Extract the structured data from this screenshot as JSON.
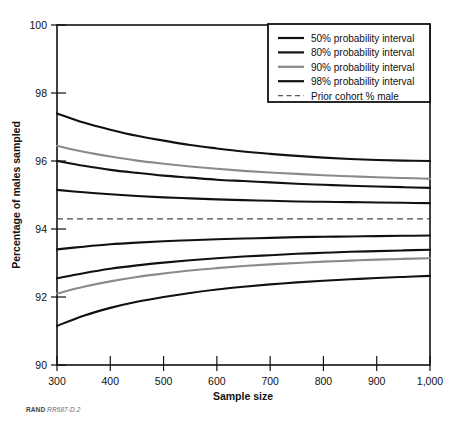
{
  "figure": {
    "source_note_prefix": "RAND",
    "source_note_id": "RR687-D.2"
  },
  "chart_data": {
    "type": "line",
    "title": "",
    "xlabel": "Sample size",
    "ylabel": "Percentage of males sampled",
    "xlim": [
      300,
      1000
    ],
    "ylim": [
      90,
      100
    ],
    "xticks": [
      300,
      400,
      500,
      600,
      700,
      800,
      900,
      1000
    ],
    "xtick_labels": [
      "300",
      "400",
      "500",
      "600",
      "700",
      "800",
      "900",
      "1,000"
    ],
    "yticks": [
      90,
      92,
      94,
      96,
      98,
      100
    ],
    "ytick_labels": [
      "90",
      "92",
      "94",
      "96",
      "98",
      "100"
    ],
    "grid": false,
    "legend_position": "top-right",
    "legend": [
      {
        "label": "50% probability interval",
        "color": "#111111",
        "style": "solid",
        "width": 2.2
      },
      {
        "label": "80% probability interval",
        "color": "#111111",
        "style": "solid",
        "width": 2.2
      },
      {
        "label": "90% probability interval",
        "color": "#8a8a8a",
        "style": "solid",
        "width": 2.2
      },
      {
        "label": "98% probability interval",
        "color": "#111111",
        "style": "solid",
        "width": 2.2
      },
      {
        "label": "Prior cohort % male",
        "color": "#555555",
        "style": "dashed",
        "width": 1.2
      }
    ],
    "prior_cohort_percent_male": 94.3,
    "x": [
      300,
      350,
      400,
      450,
      500,
      550,
      600,
      650,
      700,
      750,
      800,
      850,
      900,
      950,
      1000
    ],
    "series": [
      {
        "name": "98% probability interval upper",
        "interval": 98,
        "bound": "upper",
        "color": "#111111",
        "values": [
          97.4,
          97.13,
          96.92,
          96.74,
          96.6,
          96.47,
          96.37,
          96.28,
          96.21,
          96.15,
          96.1,
          96.06,
          96.03,
          96.01,
          96.0
        ]
      },
      {
        "name": "90% probability interval upper",
        "interval": 90,
        "bound": "upper",
        "color": "#8a8a8a",
        "values": [
          96.45,
          96.27,
          96.13,
          96.01,
          95.92,
          95.84,
          95.77,
          95.71,
          95.66,
          95.62,
          95.58,
          95.55,
          95.52,
          95.5,
          95.48
        ]
      },
      {
        "name": "80% probability interval upper",
        "interval": 80,
        "bound": "upper",
        "color": "#111111",
        "values": [
          96.0,
          95.86,
          95.74,
          95.65,
          95.57,
          95.51,
          95.45,
          95.41,
          95.37,
          95.33,
          95.3,
          95.27,
          95.25,
          95.23,
          95.21
        ]
      },
      {
        "name": "50% probability interval upper",
        "interval": 50,
        "bound": "upper",
        "color": "#111111",
        "values": [
          95.15,
          95.08,
          95.02,
          94.97,
          94.93,
          94.9,
          94.87,
          94.85,
          94.83,
          94.81,
          94.8,
          94.79,
          94.78,
          94.77,
          94.76
        ]
      },
      {
        "name": "50% probability interval lower",
        "interval": 50,
        "bound": "lower",
        "color": "#111111",
        "values": [
          93.4,
          93.48,
          93.55,
          93.6,
          93.64,
          93.67,
          93.7,
          93.72,
          93.74,
          93.76,
          93.77,
          93.78,
          93.79,
          93.8,
          93.81
        ]
      },
      {
        "name": "80% probability interval lower",
        "interval": 80,
        "bound": "lower",
        "color": "#111111",
        "values": [
          92.55,
          92.7,
          92.83,
          92.93,
          93.01,
          93.08,
          93.14,
          93.19,
          93.23,
          93.27,
          93.3,
          93.33,
          93.35,
          93.37,
          93.39
        ]
      },
      {
        "name": "90% probability interval lower",
        "interval": 90,
        "bound": "lower",
        "color": "#8a8a8a",
        "values": [
          92.1,
          92.3,
          92.46,
          92.59,
          92.69,
          92.78,
          92.85,
          92.91,
          92.96,
          93.0,
          93.04,
          93.07,
          93.1,
          93.12,
          93.14
        ]
      },
      {
        "name": "98% probability interval lower",
        "interval": 98,
        "bound": "lower",
        "color": "#111111",
        "values": [
          91.15,
          91.45,
          91.68,
          91.86,
          92.0,
          92.12,
          92.22,
          92.3,
          92.37,
          92.43,
          92.48,
          92.52,
          92.56,
          92.59,
          92.62
        ]
      }
    ]
  }
}
